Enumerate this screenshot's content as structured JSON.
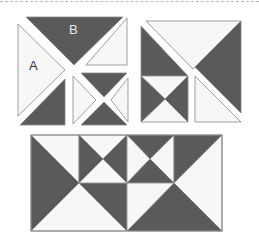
{
  "diagram": {
    "colors": {
      "dark": "#5a5a5a",
      "light": "#f7f7f7",
      "outline": "#888888"
    },
    "labels": {
      "piece_a": "A",
      "piece_b": "B"
    },
    "blocks": [
      {
        "name": "exploded-block",
        "description": "Square split along diagonals; pieces A (light triangle) and B (dark triangle) separated with a small hourglass unit"
      },
      {
        "name": "assembled-square-block",
        "description": "Square block with diagonal cut, dark/light triangles and hourglass unit"
      },
      {
        "name": "assembled-rectangle-row",
        "description": "Two square blocks joined into a rectangle with hourglass units"
      }
    ]
  }
}
